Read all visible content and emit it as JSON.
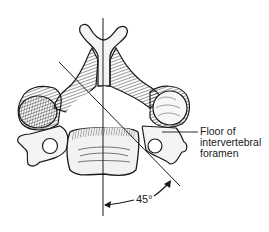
{
  "figure": {
    "annotation": {
      "lines": [
        "Floor of",
        "intervertebral",
        "foramen"
      ]
    },
    "angle_label": "45°",
    "colors": {
      "ink": "#1a1a1a",
      "bone": "#f4f4f4",
      "shade": "#6a6a6a",
      "background": "#ffffff"
    }
  }
}
